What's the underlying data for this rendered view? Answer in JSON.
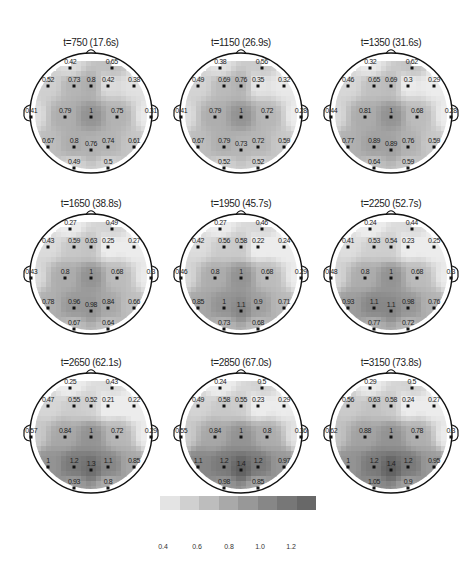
{
  "chart_data": {
    "type": "heatmap",
    "subtype": "eeg-scalp-topography",
    "title": "",
    "grid_layout": {
      "rows": 3,
      "cols": 3
    },
    "electrode_layout": [
      {
        "id": "e1",
        "x": 0.34,
        "y": 0.12
      },
      {
        "id": "e2",
        "x": 0.66,
        "y": 0.12
      },
      {
        "id": "e3",
        "x": 0.17,
        "y": 0.27
      },
      {
        "id": "e4",
        "x": 0.37,
        "y": 0.27
      },
      {
        "id": "e5",
        "x": 0.5,
        "y": 0.27
      },
      {
        "id": "e6",
        "x": 0.63,
        "y": 0.27
      },
      {
        "id": "e7",
        "x": 0.83,
        "y": 0.27
      },
      {
        "id": "e8",
        "x": 0.04,
        "y": 0.52
      },
      {
        "id": "e9",
        "x": 0.3,
        "y": 0.52
      },
      {
        "id": "e10",
        "x": 0.5,
        "y": 0.52
      },
      {
        "id": "e11",
        "x": 0.7,
        "y": 0.52
      },
      {
        "id": "e12",
        "x": 0.96,
        "y": 0.52
      },
      {
        "id": "e13",
        "x": 0.17,
        "y": 0.76
      },
      {
        "id": "e14",
        "x": 0.37,
        "y": 0.76
      },
      {
        "id": "e15",
        "x": 0.5,
        "y": 0.78
      },
      {
        "id": "e16",
        "x": 0.63,
        "y": 0.76
      },
      {
        "id": "e17",
        "x": 0.83,
        "y": 0.76
      },
      {
        "id": "e18",
        "x": 0.37,
        "y": 0.93
      },
      {
        "id": "e19",
        "x": 0.63,
        "y": 0.93
      }
    ],
    "panels": [
      {
        "title": "t=750 (17.6s)",
        "values": [
          "0.42",
          "0.65",
          "0.52",
          "0.73",
          "0.8",
          "0.42",
          "0.38",
          "0.41",
          "0.79",
          "1",
          "0.75",
          "0.31",
          "0.67",
          "0.8",
          "0.76",
          "0.74",
          "0.61",
          "0.49",
          "0.5"
        ]
      },
      {
        "title": "t=1150 (26.9s)",
        "values": [
          "0.38",
          "0.56",
          "0.49",
          "0.69",
          "0.76",
          "0.35",
          "0.32",
          "0.41",
          "0.79",
          "1",
          "0.72",
          "0.28",
          "0.67",
          "0.79",
          "0.73",
          "0.72",
          "0.59",
          "0.52",
          "0.52"
        ]
      },
      {
        "title": "t=1350 (31.6s)",
        "values": [
          "0.32",
          "0.62",
          "0.46",
          "0.65",
          "0.69",
          "0.3",
          "0.29",
          "0.44",
          "0.81",
          "1",
          "0.68",
          "0.28",
          "0.77",
          "0.89",
          "0.89",
          "0.76",
          "0.59",
          "0.64",
          "0.59"
        ]
      },
      {
        "title": "t=1650 (38.8s)",
        "values": [
          "0.27",
          "0.49",
          "0.43",
          "0.59",
          "0.63",
          "0.25",
          "0.27",
          "0.43",
          "0.8",
          "1",
          "0.68",
          "0.3",
          "0.78",
          "0.96",
          "0.98",
          "0.84",
          "0.66",
          "0.67",
          "0.64"
        ]
      },
      {
        "title": "t=1950 (45.7s)",
        "values": [
          "0.27",
          "0.46",
          "0.42",
          "0.56",
          "0.58",
          "0.22",
          "0.24",
          "0.46",
          "0.8",
          "1",
          "0.68",
          "0.29",
          "0.85",
          "1",
          "1.1",
          "0.9",
          "0.71",
          "0.73",
          "0.68"
        ]
      },
      {
        "title": "t=2250 (52.7s)",
        "values": [
          "0.24",
          "0.44",
          "0.41",
          "0.53",
          "0.54",
          "0.23",
          "0.25",
          "0.48",
          "0.8",
          "1",
          "0.68",
          "0.3",
          "0.93",
          "1.1",
          "1.1",
          "0.98",
          "0.76",
          "0.77",
          "0.72"
        ]
      },
      {
        "title": "t=2650 (62.1s)",
        "values": [
          "0.25",
          "0.43",
          "0.47",
          "0.55",
          "0.52",
          "0.21",
          "0.22",
          "0.57",
          "0.84",
          "1",
          "0.72",
          "0.29",
          "1",
          "1.2",
          "1.3",
          "1.1",
          "0.85",
          "0.93",
          "0.8"
        ]
      },
      {
        "title": "t=2850 (67.0s)",
        "values": [
          "0.24",
          "0.5",
          "0.49",
          "0.58",
          "0.55",
          "0.23",
          "0.29",
          "0.55",
          "0.84",
          "1",
          "0.8",
          "0.36",
          "1.1",
          "1.2",
          "1.4",
          "1.2",
          "0.97",
          "0.98",
          "0.85"
        ]
      },
      {
        "title": "t=3150 (73.8s)",
        "values": [
          "0.29",
          "0.5",
          "0.56",
          "0.63",
          "0.58",
          "0.24",
          "0.27",
          "0.62",
          "0.88",
          "1",
          "0.78",
          "0.3",
          "1",
          "1.2",
          "1.4",
          "1.2",
          "0.95",
          "1.05",
          "0.9"
        ]
      }
    ],
    "colorbar": {
      "ticks": [
        "0.4",
        "0.6",
        "0.8",
        "1.0",
        "1.2"
      ],
      "range": [
        0.3,
        1.4
      ],
      "colors": [
        "#e4e4e4",
        "#d0d0d0",
        "#bdbdbd",
        "#a9a9a9",
        "#989898",
        "#878787",
        "#777777",
        "#686868"
      ]
    },
    "xlabel": "",
    "ylabel": "",
    "legend": "colorbar bottom"
  }
}
